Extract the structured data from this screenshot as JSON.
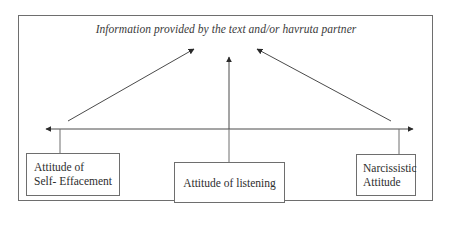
{
  "diagram": {
    "title": "Information provided by the text and/or havruta partner",
    "axis": {
      "description": "double-headed horizontal continuum arrow",
      "direction": "bidirectional"
    },
    "nodes": [
      {
        "id": "self-effacement",
        "label_lines": [
          "Attitude of",
          "Self- Effacement"
        ],
        "position": "left"
      },
      {
        "id": "listening",
        "label_lines": [
          "Attitude of listening"
        ],
        "position": "center"
      },
      {
        "id": "narcissistic",
        "label_lines": [
          "Narcissistic",
          "Attitude"
        ],
        "position": "right"
      }
    ],
    "edges": [
      {
        "from": "self-effacement",
        "to": "title",
        "style": "arrow"
      },
      {
        "from": "listening",
        "to": "title",
        "style": "arrow"
      },
      {
        "from": "narcissistic",
        "to": "title",
        "style": "arrow"
      }
    ],
    "colors": {
      "line": "#4a4a4a",
      "border": "#6e6e6e",
      "text": "#2e2e2e",
      "background": "#ffffff"
    }
  }
}
